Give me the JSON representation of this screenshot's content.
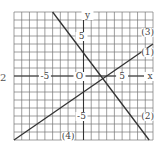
{
  "problem_number": "2",
  "chart_data": {
    "type": "line",
    "title": "",
    "xlabel": "x",
    "ylabel": "y",
    "xlim": [
      -9,
      9
    ],
    "ylim": [
      -8,
      8
    ],
    "grid": true,
    "tick_labels": {
      "x": [
        "-5",
        "5"
      ],
      "y": [
        "5",
        "-5"
      ],
      "origin": "O"
    },
    "series": [
      {
        "name": "line-up",
        "labels": [
          "(1)",
          "(3)"
        ],
        "equation": "y = 2/3 x - 2",
        "points": [
          [
            -9,
            -8
          ],
          [
            9,
            4
          ]
        ]
      },
      {
        "name": "line-down",
        "labels": [
          "(2)",
          "(4)"
        ],
        "equation": "y = -4/3 x + 8/3",
        "points": [
          [
            -4,
            8
          ],
          [
            8.5,
            -8
          ]
        ]
      }
    ],
    "annotations": [
      {
        "text": "(3)",
        "x": 8.3,
        "y": 5.5
      },
      {
        "text": "(1)",
        "x": 8.3,
        "y": 3
      },
      {
        "text": "(2)",
        "x": 8.3,
        "y": -5
      },
      {
        "text": "(4)",
        "x": -2,
        "y": -7.5
      }
    ]
  }
}
